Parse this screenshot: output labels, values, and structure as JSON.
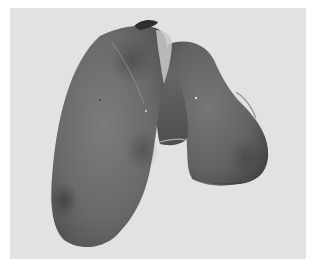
{
  "image": {
    "kind": "photograph",
    "subject": "liver-specimen",
    "tone": "grayscale",
    "colors": {
      "border": "#ffffff",
      "background": "#e2e2e2",
      "organ_light": "#8a8a8a",
      "organ_mid": "#6a6a6a",
      "organ_dark": "#4a4a4a",
      "highlight": "#c9c9c9"
    }
  }
}
